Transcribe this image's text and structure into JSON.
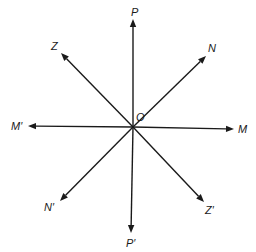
{
  "diagram": {
    "type": "line-rays-through-point",
    "center": {
      "label": "O",
      "x": 133,
      "y": 127,
      "label_x": 136,
      "label_y": 121
    },
    "rays": [
      {
        "id": "P",
        "label": "P",
        "tip_x": 133,
        "tip_y": 19,
        "label_x": 131,
        "label_y": 16
      },
      {
        "id": "P_prime",
        "label": "P′",
        "tip_x": 131,
        "tip_y": 233,
        "label_x": 126,
        "label_y": 247
      },
      {
        "id": "M",
        "label": "M",
        "tip_x": 234,
        "tip_y": 129,
        "label_x": 238,
        "label_y": 133
      },
      {
        "id": "M_prime",
        "label": "M′",
        "tip_x": 28,
        "tip_y": 126,
        "label_x": 11,
        "label_y": 130
      },
      {
        "id": "Z",
        "label": "Z",
        "tip_x": 61,
        "tip_y": 53,
        "label_x": 51,
        "label_y": 50
      },
      {
        "id": "Z_prime",
        "label": "Z′",
        "tip_x": 204,
        "tip_y": 202,
        "label_x": 205,
        "label_y": 214
      },
      {
        "id": "N",
        "label": "N",
        "tip_x": 206,
        "tip_y": 56,
        "label_x": 208,
        "label_y": 52
      },
      {
        "id": "N_prime",
        "label": "N′",
        "tip_x": 60,
        "tip_y": 201,
        "label_x": 44,
        "label_y": 211
      }
    ],
    "colors": {
      "stroke": "#1a1a1a",
      "background": "#ffffff"
    }
  }
}
